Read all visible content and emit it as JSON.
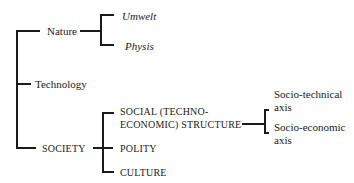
{
  "diagram": {
    "type": "tree",
    "root_children": [
      {
        "label": "Nature",
        "children": [
          {
            "label": "Umwelt"
          },
          {
            "label": "Physis"
          }
        ]
      },
      {
        "label": "Technology"
      },
      {
        "label": "SOCIETY",
        "children": [
          {
            "label_line1": "SOCIAL (TECHNO-",
            "label_line2": "ECONOMIC) STRUCTURE",
            "children": [
              {
                "label_line1": "Socio-technical",
                "label_line2": "axis"
              },
              {
                "label_line1": "Socio-economic",
                "label_line2": "axis"
              }
            ]
          },
          {
            "label": "POLITY"
          },
          {
            "label": "CULTURE"
          }
        ]
      }
    ]
  }
}
